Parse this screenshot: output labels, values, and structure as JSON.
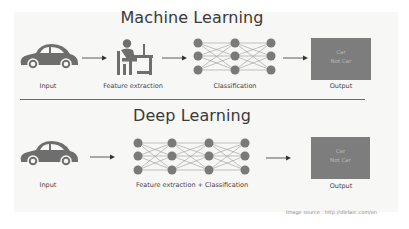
{
  "machine_learning": {
    "title": "Machine Learning",
    "stages": [
      {
        "label": "Input",
        "icon": "car-icon"
      },
      {
        "label": "Feature extraction",
        "icon": "person-at-computer-icon"
      },
      {
        "label": "Classification",
        "icon": "neural-network-icon"
      },
      {
        "label": "Output",
        "icon": "output-box"
      }
    ],
    "output_box": {
      "line1": "Car",
      "line2": "Not Car"
    }
  },
  "deep_learning": {
    "title": "Deep Learning",
    "stages": [
      {
        "label": "Input",
        "icon": "car-icon"
      },
      {
        "label": "Feature extraction + Classification",
        "icon": "deep-neural-network-icon"
      },
      {
        "label": "Output",
        "icon": "output-box"
      }
    ],
    "output_box": {
      "line1": "Car",
      "line2": "Not Car"
    }
  },
  "source": "Image source : http://dlelarc.com/en",
  "colors": {
    "node": "#7a7a7a",
    "icon": "#6e6e6e",
    "output_box": "#7d7d7d",
    "background": "#f7f7f6"
  }
}
